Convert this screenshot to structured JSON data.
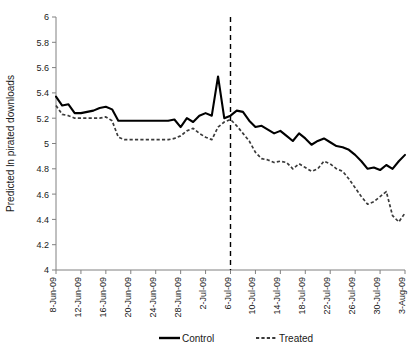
{
  "chart_data": {
    "type": "line",
    "title": "",
    "xlabel": "",
    "ylabel": "Predicted ln pirated downloads",
    "ylim": [
      4,
      6
    ],
    "yticks": [
      "4",
      "4.2",
      "4.4",
      "4.6",
      "4.8",
      "5",
      "5.2",
      "5.4",
      "5.6",
      "5.8",
      "6"
    ],
    "grid": false,
    "legend_position": "bottom",
    "x": [
      "8-Jun-09",
      "9-Jun-09",
      "10-Jun-09",
      "11-Jun-09",
      "12-Jun-09",
      "13-Jun-09",
      "14-Jun-09",
      "15-Jun-09",
      "16-Jun-09",
      "17-Jun-09",
      "18-Jun-09",
      "19-Jun-09",
      "20-Jun-09",
      "21-Jun-09",
      "22-Jun-09",
      "23-Jun-09",
      "24-Jun-09",
      "25-Jun-09",
      "26-Jun-09",
      "27-Jun-09",
      "28-Jun-09",
      "29-Jun-09",
      "30-Jun-09",
      "1-Jul-09",
      "2-Jul-09",
      "3-Jul-09",
      "4-Jul-09",
      "5-Jul-09",
      "6-Jul-09",
      "7-Jul-09",
      "8-Jul-09",
      "9-Jul-09",
      "10-Jul-09",
      "11-Jul-09",
      "12-Jul-09",
      "13-Jul-09",
      "14-Jul-09",
      "15-Jul-09",
      "16-Jul-09",
      "17-Jul-09",
      "18-Jul-09",
      "19-Jul-09",
      "20-Jul-09",
      "21-Jul-09",
      "22-Jul-09",
      "23-Jul-09",
      "24-Jul-09",
      "25-Jul-09",
      "26-Jul-09",
      "27-Jul-09",
      "28-Jul-09",
      "29-Jul-09",
      "30-Jul-09",
      "31-Jul-09",
      "1-Aug-09",
      "2-Aug-09",
      "3-Aug-09"
    ],
    "xtick_labels": [
      "8-Jun-09",
      "12-Jun-09",
      "16-Jun-09",
      "20-Jun-09",
      "24-Jun-09",
      "28-Jun-09",
      "2-Jul-09",
      "6-Jul-09",
      "10-Jul-09",
      "14-Jul-09",
      "18-Jul-09",
      "22-Jul-09",
      "26-Jul-09",
      "30-Jul-09",
      "3-Aug-09"
    ],
    "xtick_indices": [
      0,
      4,
      8,
      12,
      16,
      20,
      24,
      28,
      32,
      36,
      40,
      44,
      48,
      52,
      56
    ],
    "series": [
      {
        "name": "Control",
        "style": "solid",
        "color": "#000000",
        "values": [
          5.37,
          5.3,
          5.31,
          5.24,
          5.24,
          5.25,
          5.26,
          5.28,
          5.29,
          5.27,
          5.18,
          5.18,
          5.18,
          5.18,
          5.18,
          5.18,
          5.18,
          5.18,
          5.18,
          5.19,
          5.13,
          5.2,
          5.17,
          5.22,
          5.24,
          5.22,
          5.53,
          5.2,
          5.22,
          5.26,
          5.25,
          5.18,
          5.13,
          5.14,
          5.11,
          5.08,
          5.1,
          5.06,
          5.02,
          5.08,
          5.04,
          4.99,
          5.02,
          5.04,
          5.01,
          4.98,
          4.97,
          4.95,
          4.91,
          4.86,
          4.8,
          4.81,
          4.79,
          4.83,
          4.8,
          4.86,
          4.91
        ]
      },
      {
        "name": "Treated",
        "style": "dashed",
        "color": "#3a3a3a",
        "values": [
          5.3,
          5.23,
          5.22,
          5.2,
          5.2,
          5.2,
          5.2,
          5.2,
          5.21,
          5.18,
          5.05,
          5.03,
          5.03,
          5.03,
          5.03,
          5.03,
          5.03,
          5.03,
          5.03,
          5.04,
          5.06,
          5.1,
          5.12,
          5.08,
          5.05,
          5.03,
          5.13,
          5.17,
          5.19,
          5.14,
          5.08,
          5.02,
          4.93,
          4.88,
          4.87,
          4.85,
          4.86,
          4.85,
          4.8,
          4.84,
          4.81,
          4.78,
          4.8,
          4.86,
          4.84,
          4.8,
          4.78,
          4.72,
          4.65,
          4.58,
          4.52,
          4.54,
          4.58,
          4.62,
          4.43,
          4.38,
          4.45
        ]
      }
    ],
    "vertical_marker": {
      "label": "6-Jul-09",
      "index": 28
    }
  },
  "legend": {
    "control_label": "Control",
    "treated_label": "Treated"
  },
  "axes": {
    "y_title": "Predicted ln pirated downloads"
  }
}
